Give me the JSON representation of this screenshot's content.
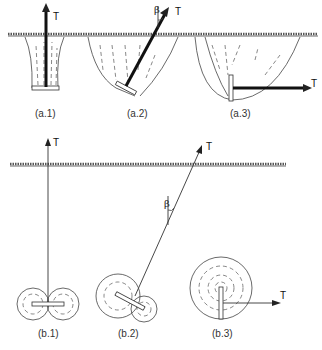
{
  "figure": {
    "top_row": {
      "panels": [
        {
          "id": "a1",
          "label": "(a.1)",
          "force_label": "T",
          "load": "vertical pull",
          "angle_label": ""
        },
        {
          "id": "a2",
          "label": "(a.2)",
          "force_label": "T",
          "load": "inclined pull",
          "angle_label": "β"
        },
        {
          "id": "a3",
          "label": "(a.3)",
          "force_label": "T",
          "load": "horizontal pull",
          "angle_label": ""
        }
      ]
    },
    "bottom_row": {
      "panels": [
        {
          "id": "b1",
          "label": "(b.1)",
          "force_label": "T",
          "load": "vertical pull (plan view)",
          "angle_label": ""
        },
        {
          "id": "b2",
          "label": "(b.2)",
          "force_label": "T",
          "load": "inclined pull (plan view)",
          "angle_label": "β"
        },
        {
          "id": "b3",
          "label": "(b.3)",
          "force_label": "T",
          "load": "horizontal pull (plan view)",
          "angle_label": ""
        }
      ]
    },
    "colors": {
      "ink": "#222222",
      "background": "#ffffff"
    }
  }
}
